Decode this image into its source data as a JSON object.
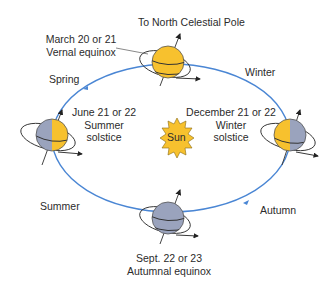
{
  "title": "To North Celestial Pole",
  "sun": {
    "label": "Sun",
    "color": "#f7c12e"
  },
  "colors": {
    "orbit": "#4a86d4",
    "day_side": "#f7c12e",
    "night_side": "#9aa3bd",
    "outline": "#333333",
    "text": "#2b2b2b"
  },
  "positions": [
    {
      "id": "vernal",
      "line1": "March 20 or 21",
      "line2": "Vernal equinox"
    },
    {
      "id": "summer",
      "line1": "June 21 or 22",
      "line2": "Summer",
      "line3": "solstice"
    },
    {
      "id": "winter",
      "line1": "December 21 or 22",
      "line2": "Winter",
      "line3": "solstice"
    },
    {
      "id": "autumnal",
      "line1": "Sept. 22 or 23",
      "line2": "Autumnal equinox"
    }
  ],
  "seasons": {
    "spring": "Spring",
    "winter": "Winter",
    "summer": "Summer",
    "autumn": "Autumn"
  }
}
